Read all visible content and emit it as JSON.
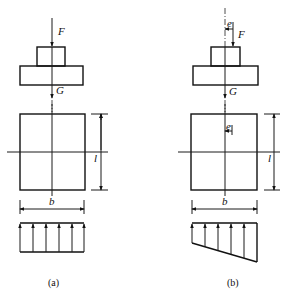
{
  "figure": {
    "panels": [
      {
        "id": "a",
        "caption": "(a)",
        "labels": {
          "force": "F",
          "weight": "G",
          "length": "l",
          "width": "b"
        },
        "pressure_distribution": "uniform"
      },
      {
        "id": "b",
        "caption": "(b)",
        "labels": {
          "force": "F",
          "weight": "G",
          "length": "l",
          "width": "b",
          "eccentricity_top": "e",
          "eccentricity_plan": "e"
        },
        "pressure_distribution": "trapezoidal"
      }
    ]
  }
}
